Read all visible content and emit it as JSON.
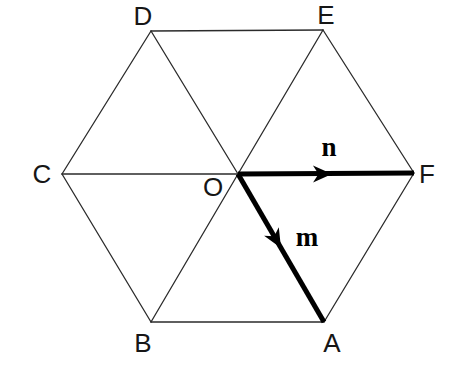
{
  "figure": {
    "background_color": "#ffffff",
    "thin_line_color": "#2b2b2b",
    "thick_line_color": "#000000",
    "thin_line_width": 1.3,
    "thick_line_width": 5,
    "label_color": "#161616",
    "width": 454,
    "height": 373
  },
  "hexagon": {
    "name": "regular-hexagon",
    "centre": {
      "label": "O",
      "x": 238,
      "y": 174,
      "label_x": 213,
      "label_y": 187
    },
    "vertices": [
      {
        "label": "A",
        "x": 324,
        "y": 322,
        "label_x": 332,
        "label_y": 343
      },
      {
        "label": "B",
        "x": 151,
        "y": 322,
        "label_x": 143,
        "label_y": 343
      },
      {
        "label": "C",
        "x": 62,
        "y": 174,
        "label_x": 42,
        "label_y": 174
      },
      {
        "label": "D",
        "x": 151,
        "y": 31,
        "label_x": 143,
        "label_y": 16
      },
      {
        "label": "E",
        "x": 323,
        "y": 30,
        "label_x": 326,
        "label_y": 15
      },
      {
        "label": "F",
        "x": 414,
        "y": 173,
        "label_x": 427,
        "label_y": 174
      }
    ],
    "perimeter_edges": [
      {
        "name": "edge-AB",
        "from": "A",
        "to": "B"
      },
      {
        "name": "edge-BC",
        "from": "B",
        "to": "C"
      },
      {
        "name": "edge-CD",
        "from": "C",
        "to": "D"
      },
      {
        "name": "edge-DE",
        "from": "D",
        "to": "E"
      },
      {
        "name": "edge-EF",
        "from": "E",
        "to": "F"
      },
      {
        "name": "edge-FA",
        "from": "F",
        "to": "A"
      }
    ],
    "diagonals_through_centre": [
      {
        "name": "diagonal-C-O",
        "from": "C",
        "to": "O",
        "style": "thin"
      },
      {
        "name": "diagonal-D-O",
        "from": "D",
        "to": "O",
        "style": "thin"
      },
      {
        "name": "diagonal-E-O",
        "from": "E",
        "to": "O",
        "style": "thin"
      },
      {
        "name": "diagonal-B-O",
        "from": "B",
        "to": "O",
        "style": "thin"
      }
    ]
  },
  "vectors": [
    {
      "label": "n",
      "name": "vector-n",
      "from": "O",
      "to": "F",
      "x1": 238,
      "y1": 174,
      "x2": 414,
      "y2": 173,
      "arrowhead_x": 332,
      "arrowhead_y": 174,
      "label_x": 329,
      "label_y": 147,
      "style": "thick",
      "color": "#000000"
    },
    {
      "label": "m",
      "name": "vector-m",
      "from": "O",
      "to": "A",
      "x1": 238,
      "y1": 174,
      "x2": 324,
      "y2": 322,
      "arrowhead_x": 281,
      "arrowhead_y": 248,
      "label_x": 307,
      "label_y": 237,
      "style": "thick",
      "color": "#000000"
    }
  ]
}
